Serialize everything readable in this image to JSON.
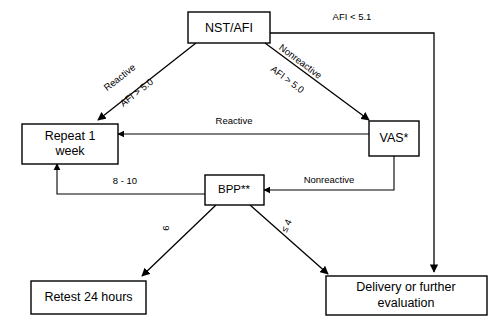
{
  "diagram": {
    "type": "flowchart",
    "title": "",
    "nodes": [
      {
        "id": "nst_afi",
        "label": "NST/AFI"
      },
      {
        "id": "vas",
        "label": "VAS*"
      },
      {
        "id": "repeat",
        "label_line1": "Repeat 1",
        "label_line2": "week"
      },
      {
        "id": "bpp",
        "label": "BPP**"
      },
      {
        "id": "retest",
        "label": "Retest 24 hours"
      },
      {
        "id": "delivery",
        "label_line1": "Delivery or further",
        "label_line2": "evaluation"
      }
    ],
    "edges": [
      {
        "id": "nst-to-repeat",
        "from": "nst_afi",
        "to": "repeat",
        "label_line1": "Reactive",
        "label_line2": "AFI > 5.0"
      },
      {
        "id": "nst-to-vas",
        "from": "nst_afi",
        "to": "vas",
        "label_line1": "Nonreactive",
        "label_line2": "AFI > 5.0"
      },
      {
        "id": "nst-to-delivery",
        "from": "nst_afi",
        "to": "delivery",
        "label_line1": "AFI < 5.1",
        "label_line2": ""
      },
      {
        "id": "vas-to-repeat",
        "from": "vas",
        "to": "repeat",
        "label_line1": "Reactive",
        "label_line2": ""
      },
      {
        "id": "vas-to-bpp",
        "from": "vas",
        "to": "bpp",
        "label_line1": "Nonreactive",
        "label_line2": ""
      },
      {
        "id": "bpp-to-repeat",
        "from": "bpp",
        "to": "repeat",
        "label_line1": "8 - 10",
        "label_line2": ""
      },
      {
        "id": "bpp-to-retest",
        "from": "bpp",
        "to": "retest",
        "label_line1": "6",
        "label_line2": ""
      },
      {
        "id": "bpp-to-delivery",
        "from": "bpp",
        "to": "delivery",
        "label_line1": "≤ 4",
        "label_line2": ""
      }
    ],
    "colors": {
      "stroke": "#000000",
      "fill": "#ffffff",
      "text": "#000000"
    }
  }
}
